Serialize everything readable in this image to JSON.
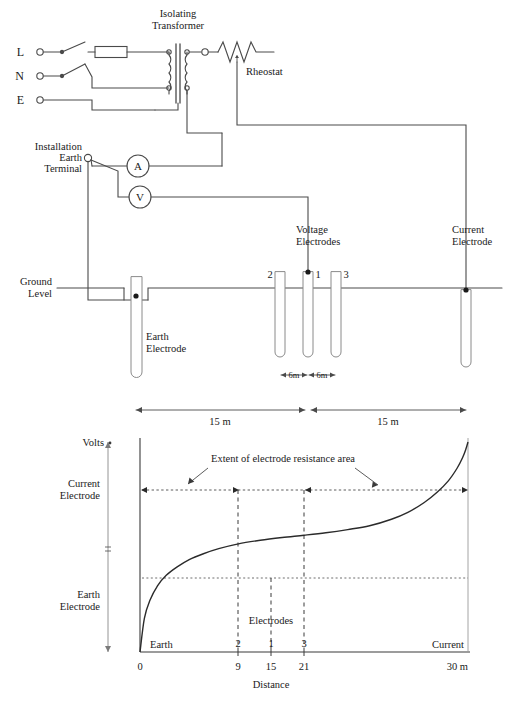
{
  "figure": {
    "title_top": "Earth electrode resistance measurement circuit",
    "title_bottom": "Potential gradient / electrode resistance areas"
  },
  "circuit": {
    "supply_terminals": [
      {
        "id": "L",
        "label": "L"
      },
      {
        "id": "N",
        "label": "N"
      },
      {
        "id": "E",
        "label": "E"
      }
    ],
    "transformer_label_line1": "Isolating",
    "transformer_label_line2": "Transformer",
    "rheostat_label": "Rheostat",
    "ammeter_label": "A",
    "voltmeter_label": "V",
    "installation_earth_terminal_line1": "Installation",
    "installation_earth_terminal_line2": "Earth",
    "installation_earth_terminal_line3": "Terminal",
    "ground_level_line1": "Ground",
    "ground_level_line2": "Level",
    "earth_electrode_line1": "Earth",
    "earth_electrode_line2": "Electrode",
    "voltage_electrodes_line1": "Voltage",
    "voltage_electrodes_line2": "Electrodes",
    "current_electrode_line1": "Current",
    "current_electrode_line2": "Electrode",
    "electrode_numbers": [
      "2",
      "1",
      "3"
    ],
    "spacing_labels": [
      "6m",
      "6m"
    ],
    "span_labels": [
      "15 m",
      "15 m"
    ]
  },
  "chart_data": {
    "type": "line",
    "title": "",
    "xlabel": "Distance",
    "ylabel": "Volts",
    "xlim": [
      0,
      30
    ],
    "ylim": [
      0,
      1
    ],
    "grid": false,
    "x_unit": "m",
    "xticks": [
      0,
      9,
      15,
      21,
      30
    ],
    "xticklabels": [
      "0",
      "9",
      "15",
      "21",
      "30 m"
    ],
    "x_axis_end_label": "30 m",
    "electrode_tick_labels": [
      "2",
      "1",
      "3"
    ],
    "electrode_tick_positions": [
      9,
      15,
      21
    ],
    "electrodes_caption": "Electrodes",
    "earth_end_label": "Earth",
    "current_end_label": "Current",
    "y_axis_top_label": "Volts",
    "y_label_current_electrode_line1": "Current",
    "y_label_current_electrode_line2": "Electrode",
    "y_label_earth_electrode_line1": "Earth",
    "y_label_earth_electrode_line2": "Electrode",
    "annotation": "Extent of electrode resistance area",
    "resistance_area_left_span": [
      0,
      9
    ],
    "resistance_area_right_span": [
      21,
      30
    ],
    "plateau_level": 0.52,
    "upper_level": 0.86,
    "series": [
      {
        "name": "Potential gradient",
        "x": [
          0,
          0.4,
          0.9,
          1.6,
          2.4,
          3.4,
          4.5,
          5.8,
          7.2,
          9.0,
          11.0,
          13.0,
          15.0,
          17.0,
          19.0,
          21.0,
          23.0,
          24.5,
          26.0,
          27.2,
          28.2,
          29.0,
          29.5,
          29.8,
          30.0
        ],
        "values": [
          0.0,
          0.16,
          0.245,
          0.315,
          0.365,
          0.405,
          0.44,
          0.468,
          0.492,
          0.515,
          0.532,
          0.545,
          0.556,
          0.568,
          0.583,
          0.601,
          0.632,
          0.665,
          0.712,
          0.762,
          0.815,
          0.875,
          0.925,
          0.965,
          1.0
        ]
      }
    ]
  }
}
